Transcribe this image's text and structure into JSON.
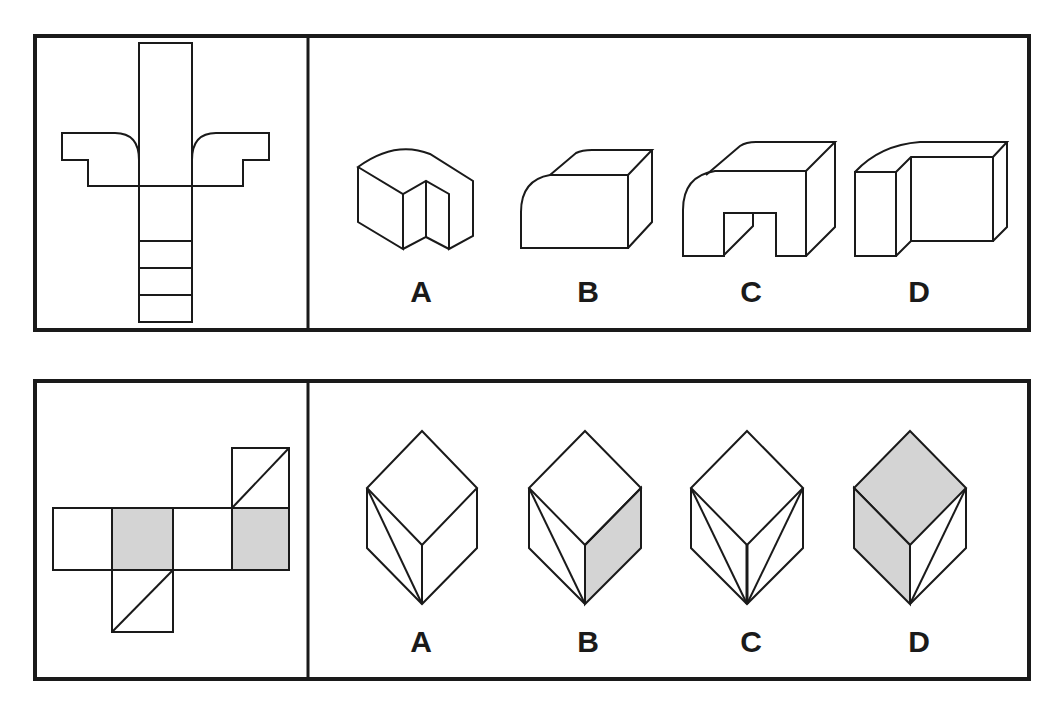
{
  "puzzles": [
    {
      "id": "puzzle-1",
      "net_description": "Unfolded net: vertical strip with two winged side flaps having rounded inner corners, lower strip divided into segments",
      "options": [
        {
          "label": "A",
          "description": "Block with rounded top edge and vertical notch in front"
        },
        {
          "label": "B",
          "description": "Rectangular block with rounded front-left edge"
        },
        {
          "label": "C",
          "description": "Arch-shaped block with rounded top-left edge and rectangular opening"
        },
        {
          "label": "D",
          "description": "Stepped block with rounded top-left edge"
        }
      ]
    },
    {
      "id": "puzzle-2",
      "net_description": "Cube net of six squares: two gray squares, two squares split by diagonals",
      "options": [
        {
          "label": "A",
          "description": "Cube with diagonal on left face"
        },
        {
          "label": "B",
          "description": "Cube with diagonal on left face and gray right face"
        },
        {
          "label": "C",
          "description": "Cube with diagonals on left and right faces"
        },
        {
          "label": "D",
          "description": "Cube with gray top and left faces, diagonal on right face"
        }
      ]
    }
  ],
  "colors": {
    "line": "#1a1a1a",
    "shade": "#d4d4d4",
    "background": "#ffffff"
  }
}
